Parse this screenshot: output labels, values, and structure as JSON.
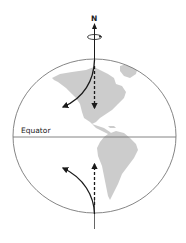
{
  "diagram": {
    "type": "coriolis-effect-globe",
    "labels": {
      "north": "N",
      "equator": "Equator"
    },
    "colors": {
      "background": "#ffffff",
      "outline": "#777777",
      "land": "#cccccc",
      "arrow": "#1a1a1a"
    },
    "elements": [
      {
        "name": "rotation-axis",
        "description": "vertical axis through north pole with rotation symbol"
      },
      {
        "name": "northern-hemisphere-straight-path",
        "style": "dashed",
        "direction": "south"
      },
      {
        "name": "northern-hemisphere-deflected-path",
        "style": "solid",
        "direction": "south-west (deflected right)"
      },
      {
        "name": "southern-hemisphere-straight-path",
        "style": "dashed",
        "direction": "north"
      },
      {
        "name": "southern-hemisphere-deflected-path",
        "style": "solid",
        "direction": "north-west (deflected left)"
      }
    ]
  }
}
